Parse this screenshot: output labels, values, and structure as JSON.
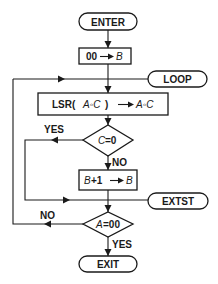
{
  "flowchart": {
    "colors": {
      "stroke": "#1a1a1a",
      "background": "#ffffff"
    },
    "nodes": {
      "enter": {
        "type": "terminal",
        "label": "ENTER"
      },
      "init": {
        "type": "process",
        "lhs": "00",
        "rhs": "B"
      },
      "loop": {
        "type": "terminal",
        "label": "LOOP"
      },
      "shift": {
        "type": "process",
        "lhs": "LSR(A◦C)",
        "lhs_op": "LSR(",
        "lhs_var": "A◦C",
        "lhs_close": ")",
        "rhs": "A◦C"
      },
      "test_c": {
        "type": "decision",
        "var": "C",
        "op": "=0"
      },
      "increment": {
        "type": "process",
        "lhs_var": "B",
        "lhs_rest": "+1",
        "rhs": "B"
      },
      "extst": {
        "type": "terminal",
        "label": "EXTST"
      },
      "test_a": {
        "type": "decision",
        "var": "A",
        "op": "=00"
      },
      "exit": {
        "type": "terminal",
        "label": "EXIT"
      }
    },
    "edge_labels": {
      "test_c_yes": "YES",
      "test_c_no": "NO",
      "test_a_no": "NO",
      "test_a_yes": "YES"
    }
  }
}
